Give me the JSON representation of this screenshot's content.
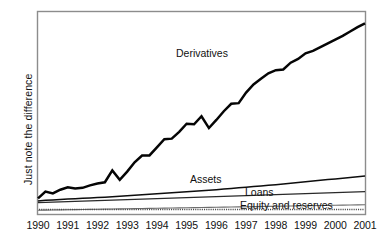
{
  "chart_data": {
    "type": "line",
    "title": "",
    "xlabel": "",
    "ylabel": "Just note the difference",
    "grid": false,
    "legend_position": "inline-annotations",
    "axis": {
      "x_tick_labels": [
        "1990",
        "1991",
        "1992",
        "1993",
        "1994",
        "1995",
        "1996",
        "1997",
        "1998",
        "1999",
        "2000",
        "2001"
      ],
      "x_range": [
        1990,
        2001
      ],
      "y_tick_labels": [],
      "y_axis_values_shown": false,
      "baseline_style": "dotted"
    },
    "annotations": [
      {
        "text": "Derivatives",
        "series": "Derivatives"
      },
      {
        "text": "Assets",
        "series": "Assets"
      },
      {
        "text": "Loans",
        "series": "Loans"
      },
      {
        "text": "Equity and reserves",
        "series": "Equity and reserves"
      }
    ],
    "x": [
      1990.0,
      1990.25,
      1990.5,
      1990.75,
      1991.0,
      1991.25,
      1991.5,
      1991.75,
      1992.0,
      1992.25,
      1992.5,
      1992.75,
      1993.0,
      1993.25,
      1993.5,
      1993.75,
      1994.0,
      1994.25,
      1994.5,
      1994.75,
      1995.0,
      1995.25,
      1995.5,
      1995.75,
      1996.0,
      1996.25,
      1996.5,
      1996.75,
      1997.0,
      1997.25,
      1997.5,
      1997.75,
      1998.0,
      1998.25,
      1998.5,
      1998.75,
      1999.0,
      1999.25,
      1999.5,
      1999.75,
      2000.0,
      2000.25,
      2000.5,
      2000.75,
      2001.0
    ],
    "series": [
      {
        "name": "Derivatives",
        "values": [
          12.5,
          18.0,
          16.5,
          19.5,
          21.5,
          20.5,
          21.0,
          23.0,
          24.5,
          25.5,
          35.0,
          27.5,
          34.0,
          41.5,
          47.0,
          47.0,
          53.5,
          60.0,
          60.5,
          66.0,
          72.5,
          72.0,
          78.5,
          69.0,
          75.5,
          82.5,
          88.5,
          89.0,
          97.5,
          104.0,
          108.5,
          113.0,
          115.5,
          116.0,
          121.5,
          124.5,
          129.0,
          131.0,
          134.0,
          137.0,
          140.0,
          143.0,
          146.5,
          150.0,
          153.0
        ]
      },
      {
        "name": "Assets",
        "values": [
          10.5,
          11.0,
          11.3,
          11.7,
          12.0,
          12.3,
          12.6,
          12.9,
          13.2,
          13.5,
          13.9,
          14.2,
          14.6,
          15.0,
          15.4,
          15.8,
          16.2,
          16.6,
          17.0,
          17.4,
          17.8,
          18.2,
          18.6,
          19.0,
          19.5,
          20.0,
          20.5,
          21.0,
          21.5,
          22.0,
          22.5,
          23.0,
          23.5,
          24.0,
          24.6,
          25.2,
          25.8,
          26.4,
          27.0,
          27.6,
          28.2,
          28.8,
          29.4,
          30.0,
          30.6
        ]
      },
      {
        "name": "Loans",
        "values": [
          9.2,
          9.4,
          9.6,
          9.8,
          10.0,
          10.2,
          10.4,
          10.6,
          10.8,
          11.0,
          11.2,
          11.4,
          11.6,
          11.8,
          12.0,
          12.2,
          12.4,
          12.6,
          12.8,
          13.0,
          13.2,
          13.4,
          13.6,
          13.8,
          14.0,
          14.2,
          14.4,
          14.6,
          14.8,
          15.0,
          15.2,
          15.4,
          15.6,
          15.8,
          16.0,
          16.2,
          16.4,
          16.6,
          16.8,
          17.0,
          17.2,
          17.4,
          17.6,
          17.8,
          18.0
        ]
      },
      {
        "name": "Equity and reserves",
        "values": [
          3.0,
          3.1,
          3.2,
          3.3,
          3.4,
          3.5,
          3.6,
          3.7,
          3.8,
          3.9,
          4.0,
          4.1,
          4.2,
          4.3,
          4.4,
          4.5,
          4.6,
          4.7,
          4.8,
          4.9,
          5.0,
          5.1,
          5.2,
          5.3,
          5.4,
          5.5,
          5.6,
          5.7,
          5.8,
          5.9,
          6.0,
          6.1,
          6.2,
          6.3,
          6.4,
          6.5,
          6.6,
          6.7,
          6.8,
          6.9,
          7.0,
          7.1,
          7.2,
          7.3,
          7.4
        ]
      }
    ],
    "colors": {
      "derivatives": "#050505",
      "assets": "#0d0d0d",
      "loans": "#2a2a2a",
      "equity": "#6e6e6e",
      "frame": "#8c8c8c",
      "baseline": "#4a4a4a",
      "background": "#ffffff"
    }
  }
}
